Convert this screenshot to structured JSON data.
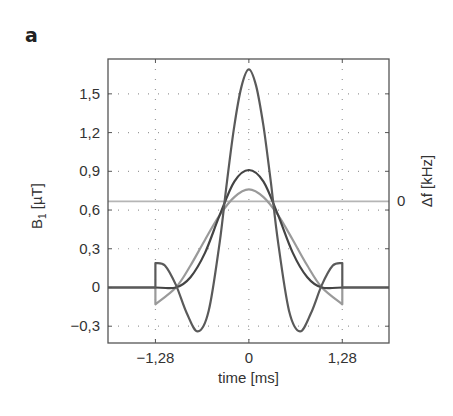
{
  "panel_label": "a",
  "chart_data": {
    "type": "line",
    "title": "",
    "xlabel": "time [ms]",
    "ylabel": "B1 [µT]",
    "ylabel_main": "B",
    "ylabel_sub": "1",
    "ylabel_unit": " [µT]",
    "y2label": "Δf [kHz]",
    "xlim": [
      -1.93,
      1.92
    ],
    "ylim": [
      -0.43,
      1.77
    ],
    "x_ticks": [
      -1.28,
      0,
      1.28
    ],
    "x_tick_labels": [
      "−1,28",
      "0",
      "1,28"
    ],
    "y_ticks": [
      1.5,
      1.2,
      0.9,
      0.6,
      0.3,
      0,
      -0.3
    ],
    "y_tick_labels": [
      "1,5",
      "1,2",
      "0,9",
      "0,6",
      "0,3",
      "0",
      "−0,3"
    ],
    "y2_ticks": [
      0.667
    ],
    "y2_tick_labels": [
      "0"
    ],
    "grid": "dotted",
    "legend": "none",
    "series": [
      {
        "name": "tall sinc pulse",
        "color": "#5a5a5a",
        "x": [
          -1.93,
          -1.28,
          -1.28,
          -1.15,
          -1.0,
          -0.85,
          -0.7,
          -0.55,
          -0.4,
          -0.3,
          -0.2,
          -0.1,
          0,
          0.1,
          0.2,
          0.3,
          0.4,
          0.55,
          0.7,
          0.85,
          1.0,
          1.15,
          1.28,
          1.28,
          1.92
        ],
        "values": [
          0,
          0,
          0.19,
          0.17,
          0.02,
          -0.2,
          -0.34,
          -0.18,
          0.35,
          0.82,
          1.25,
          1.56,
          1.69,
          1.56,
          1.25,
          0.82,
          0.35,
          -0.18,
          -0.34,
          -0.2,
          0.02,
          0.17,
          0.19,
          0,
          0
        ]
      },
      {
        "name": "medium pulse",
        "color": "#444444",
        "x": [
          -1.93,
          -1.28,
          -1.0,
          -0.8,
          -0.6,
          -0.4,
          -0.2,
          0,
          0.2,
          0.4,
          0.6,
          0.8,
          1.0,
          1.28,
          1.92
        ],
        "values": [
          0,
          0,
          0.0,
          0.08,
          0.27,
          0.56,
          0.82,
          0.91,
          0.82,
          0.56,
          0.27,
          0.08,
          0.0,
          0,
          0
        ]
      },
      {
        "name": "light pulse",
        "color": "#9a9a9a",
        "x": [
          -1.28,
          -1.28,
          -1.0,
          -0.8,
          -0.6,
          -0.4,
          -0.2,
          0,
          0.2,
          0.4,
          0.6,
          0.8,
          1.0,
          1.28,
          1.28
        ],
        "values": [
          0.0,
          -0.13,
          0.0,
          0.17,
          0.37,
          0.56,
          0.7,
          0.76,
          0.7,
          0.56,
          0.37,
          0.17,
          0.0,
          -0.13,
          0.0
        ]
      },
      {
        "name": "Δf (frequency offset)",
        "color": "#b5b5b5",
        "axis": "right",
        "x": [
          -1.93,
          1.92
        ],
        "values": [
          0.667,
          0.667
        ]
      }
    ]
  }
}
